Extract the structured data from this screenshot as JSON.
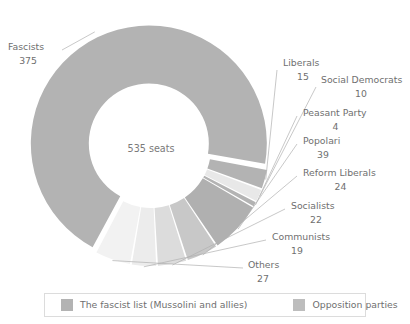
{
  "chart_data": {
    "type": "pie",
    "variant": "donut",
    "title": "",
    "subtitle": "",
    "center_label": "535 seats",
    "total": 535,
    "total_unit": "seats",
    "categories": [
      "Fascists",
      "Liberals",
      "Social Democrats",
      "Peasant Party",
      "Popolari",
      "Reform Liberals",
      "Socialists",
      "Communists",
      "Others"
    ],
    "values": [
      375,
      15,
      10,
      4,
      39,
      24,
      22,
      19,
      27
    ],
    "slices": [
      {
        "label": "Fascists",
        "value": 375,
        "group": "fascist",
        "color": "#b3b3b3",
        "exploded": true
      },
      {
        "label": "Liberals",
        "value": 15,
        "group": "opposition",
        "color": "#b3b3b3"
      },
      {
        "label": "Social Democrats",
        "value": 10,
        "group": "opposition",
        "color": "#e8e8e8"
      },
      {
        "label": "Peasant Party",
        "value": 4,
        "group": "opposition",
        "color": "#b3b3b3"
      },
      {
        "label": "Popolari",
        "value": 39,
        "group": "opposition",
        "color": "#b0b0b0"
      },
      {
        "label": "Reform Liberals",
        "value": 24,
        "group": "opposition",
        "color": "#c8c8c8"
      },
      {
        "label": "Socialists",
        "value": 22,
        "group": "opposition",
        "color": "#dcdcdc"
      },
      {
        "label": "Communists",
        "value": 19,
        "group": "opposition",
        "color": "#ececec"
      },
      {
        "label": "Others",
        "value": 27,
        "group": "opposition",
        "color": "#f2f2f2"
      }
    ],
    "legend": {
      "position": "bottom",
      "entries": [
        {
          "label": "The fascist list (Mussolini and allies)",
          "color": "#b3b3b3"
        },
        {
          "label": "Opposition parties",
          "color": "#bdbdbd"
        }
      ]
    },
    "grid": false,
    "xlabel": "",
    "ylabel": ""
  },
  "colors": {
    "text": "#6f6f6f",
    "leader_line": "#b0b0b0",
    "legend_border": "#dcdcdc",
    "background": "#ffffff",
    "fascist": "#b3b3b3",
    "opposition": "#bdbdbd"
  }
}
